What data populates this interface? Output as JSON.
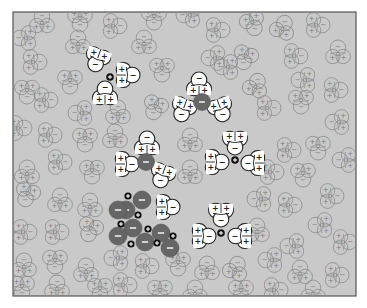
{
  "figure": {
    "frame": {
      "x": 13,
      "y": 12,
      "w": 343,
      "h": 284
    },
    "colors": {
      "background_fill": "#c9c9c9",
      "frame_stroke": "#555555",
      "background_water_stroke": "#8a8a8a",
      "hydration_water_fill": "#ffffff",
      "anion_fill": "#666666",
      "cation_fill": "#111111"
    },
    "legend_symbols": {
      "positive": "+",
      "negative": "−"
    }
  },
  "hydrated_cations": [
    {
      "cx": 110,
      "cy": 77,
      "waters": [
        {
          "x": 97,
          "y": 60,
          "rot": 200
        },
        {
          "x": 128,
          "y": 75,
          "rot": 90
        },
        {
          "x": 105,
          "y": 93,
          "rot": 0
        }
      ]
    },
    {
      "cx": 235,
      "cy": 160,
      "waters": [
        {
          "x": 235,
          "y": 143,
          "rot": 180
        },
        {
          "x": 217,
          "y": 162,
          "rot": 90
        },
        {
          "x": 253,
          "y": 163,
          "rot": 270
        }
      ]
    },
    {
      "cx": 221,
      "cy": 233,
      "waters": [
        {
          "x": 221,
          "y": 215,
          "rot": 180
        },
        {
          "x": 204,
          "y": 236,
          "rot": 90
        },
        {
          "x": 240,
          "y": 236,
          "rot": 270
        }
      ]
    }
  ],
  "hydrated_anions": [
    {
      "cx": 202,
      "cy": 102,
      "waters": [
        {
          "x": 199,
          "y": 84,
          "rot": 0
        },
        {
          "x": 183,
          "y": 110,
          "rot": 200
        },
        {
          "x": 221,
          "y": 110,
          "rot": 160
        }
      ]
    },
    {
      "cx": 146,
      "cy": 162,
      "waters": [
        {
          "x": 147,
          "y": 143,
          "rot": 0
        },
        {
          "x": 127,
          "y": 164,
          "rot": 90
        },
        {
          "x": 162,
          "y": 176,
          "rot": 200
        }
      ]
    }
  ],
  "crystal": {
    "anions": [
      {
        "x": 142,
        "y": 200
      },
      {
        "x": 126,
        "y": 210
      },
      {
        "x": 133,
        "y": 228
      },
      {
        "x": 118,
        "y": 236
      },
      {
        "x": 145,
        "y": 242
      },
      {
        "x": 161,
        "y": 233
      },
      {
        "x": 170,
        "y": 248
      },
      {
        "x": 118,
        "y": 210
      }
    ],
    "cations": [
      {
        "x": 128,
        "y": 196
      },
      {
        "x": 138,
        "y": 215
      },
      {
        "x": 121,
        "y": 224
      },
      {
        "x": 131,
        "y": 244
      },
      {
        "x": 148,
        "y": 229
      },
      {
        "x": 157,
        "y": 243
      },
      {
        "x": 173,
        "y": 236
      }
    ],
    "side_water": {
      "x": 168,
      "y": 207,
      "rot": 90
    }
  },
  "background_waters": [
    {
      "x": 42,
      "y": 21,
      "rot": 0
    },
    {
      "x": 80,
      "y": 20,
      "rot": 180
    },
    {
      "x": 115,
      "y": 26,
      "rot": 90
    },
    {
      "x": 154,
      "y": 18,
      "rot": 180
    },
    {
      "x": 188,
      "y": 15,
      "rot": 270
    },
    {
      "x": 218,
      "y": 30,
      "rot": 90
    },
    {
      "x": 253,
      "y": 24,
      "rot": 160
    },
    {
      "x": 283,
      "y": 27,
      "rot": 20
    },
    {
      "x": 318,
      "y": 25,
      "rot": 90
    },
    {
      "x": 24,
      "y": 38,
      "rot": 270
    },
    {
      "x": 78,
      "y": 42,
      "rot": 0
    },
    {
      "x": 144,
      "y": 42,
      "rot": 0
    },
    {
      "x": 213,
      "y": 58,
      "rot": 270
    },
    {
      "x": 245,
      "y": 58,
      "rot": 200
    },
    {
      "x": 296,
      "y": 56,
      "rot": 90
    },
    {
      "x": 338,
      "y": 52,
      "rot": 0
    },
    {
      "x": 35,
      "y": 62,
      "rot": 90
    },
    {
      "x": 162,
      "y": 70,
      "rot": 180
    },
    {
      "x": 27,
      "y": 92,
      "rot": 180
    },
    {
      "x": 70,
      "y": 82,
      "rot": 180
    },
    {
      "x": 226,
      "y": 67,
      "rot": 270
    },
    {
      "x": 256,
      "y": 85,
      "rot": 20
    },
    {
      "x": 303,
      "y": 80,
      "rot": 270
    },
    {
      "x": 336,
      "y": 90,
      "rot": 90
    },
    {
      "x": 46,
      "y": 100,
      "rot": 90
    },
    {
      "x": 80,
      "y": 113,
      "rot": 270
    },
    {
      "x": 118,
      "y": 112,
      "rot": 0
    },
    {
      "x": 155,
      "y": 108,
      "rot": 200
    },
    {
      "x": 190,
      "y": 140,
      "rot": 0
    },
    {
      "x": 269,
      "y": 108,
      "rot": 90
    },
    {
      "x": 301,
      "y": 102,
      "rot": 180
    },
    {
      "x": 337,
      "y": 122,
      "rot": 270
    },
    {
      "x": 20,
      "y": 128,
      "rot": 90
    },
    {
      "x": 50,
      "y": 135,
      "rot": 90
    },
    {
      "x": 85,
      "y": 140,
      "rot": 180
    },
    {
      "x": 115,
      "y": 136,
      "rot": 0
    },
    {
      "x": 289,
      "y": 150,
      "rot": 90
    },
    {
      "x": 318,
      "y": 148,
      "rot": 180
    },
    {
      "x": 344,
      "y": 160,
      "rot": 270
    },
    {
      "x": 27,
      "y": 172,
      "rot": 0
    },
    {
      "x": 60,
      "y": 162,
      "rot": 90
    },
    {
      "x": 92,
      "y": 172,
      "rot": 180
    },
    {
      "x": 190,
      "y": 172,
      "rot": 0
    },
    {
      "x": 272,
      "y": 172,
      "rot": 90
    },
    {
      "x": 303,
      "y": 175,
      "rot": 180
    },
    {
      "x": 332,
      "y": 196,
      "rot": 90
    },
    {
      "x": 27,
      "y": 195,
      "rot": 200
    },
    {
      "x": 60,
      "y": 200,
      "rot": 0
    },
    {
      "x": 90,
      "y": 205,
      "rot": 0
    },
    {
      "x": 259,
      "y": 199,
      "rot": 270
    },
    {
      "x": 290,
      "y": 205,
      "rot": 90
    },
    {
      "x": 320,
      "y": 225,
      "rot": 270
    },
    {
      "x": 25,
      "y": 232,
      "rot": 90
    },
    {
      "x": 57,
      "y": 232,
      "rot": 90
    },
    {
      "x": 90,
      "y": 230,
      "rot": 200
    },
    {
      "x": 257,
      "y": 230,
      "rot": 0
    },
    {
      "x": 292,
      "y": 246,
      "rot": 270
    },
    {
      "x": 345,
      "y": 242,
      "rot": 90
    },
    {
      "x": 24,
      "y": 265,
      "rot": 0
    },
    {
      "x": 55,
      "y": 262,
      "rot": 180
    },
    {
      "x": 86,
      "y": 270,
      "rot": 0
    },
    {
      "x": 116,
      "y": 258,
      "rot": 270
    },
    {
      "x": 147,
      "y": 266,
      "rot": 90
    },
    {
      "x": 178,
      "y": 264,
      "rot": 180
    },
    {
      "x": 207,
      "y": 268,
      "rot": 0
    },
    {
      "x": 236,
      "y": 268,
      "rot": 20
    },
    {
      "x": 270,
      "y": 260,
      "rot": 270
    },
    {
      "x": 300,
      "y": 272,
      "rot": 0
    },
    {
      "x": 337,
      "y": 275,
      "rot": 90
    },
    {
      "x": 22,
      "y": 288,
      "rot": 180
    },
    {
      "x": 57,
      "y": 287,
      "rot": 0
    },
    {
      "x": 100,
      "y": 290,
      "rot": 180
    },
    {
      "x": 125,
      "y": 285,
      "rot": 90
    },
    {
      "x": 160,
      "y": 292,
      "rot": 180
    },
    {
      "x": 195,
      "y": 292,
      "rot": 0
    },
    {
      "x": 241,
      "y": 292,
      "rot": 180
    },
    {
      "x": 276,
      "y": 290,
      "rot": 90
    },
    {
      "x": 313,
      "y": 292,
      "rot": 0
    }
  ]
}
